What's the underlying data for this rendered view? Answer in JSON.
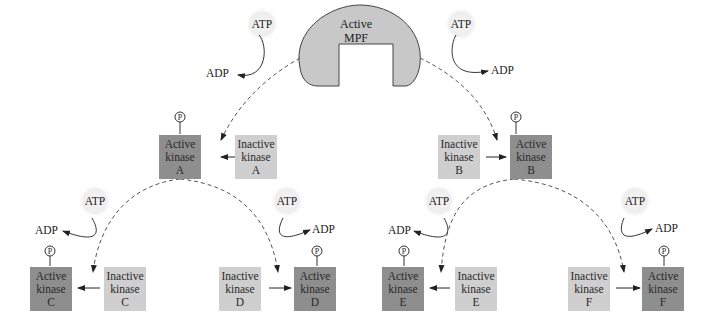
{
  "diagram": {
    "mpf": {
      "line1": "Active",
      "line2": "MPF"
    },
    "atp_label": "ATP",
    "adp_label": "ADP",
    "phosphate_label": "P",
    "colors": {
      "active": "#8e8e8e",
      "inactive": "#cfcfcf",
      "mpf": "#c8c8c8",
      "atp_glow": "#eeeeee"
    },
    "kinases": [
      {
        "id": "A",
        "active": [
          "Active",
          "kinase",
          "A"
        ],
        "inactive": [
          "Inactive",
          "kinase",
          "A"
        ]
      },
      {
        "id": "B",
        "active": [
          "Active",
          "kinase",
          "B"
        ],
        "inactive": [
          "Inactive",
          "kinase",
          "B"
        ]
      },
      {
        "id": "C",
        "active": [
          "Active",
          "kinase",
          "C"
        ],
        "inactive": [
          "Inactive",
          "kinase",
          "C"
        ]
      },
      {
        "id": "D",
        "active": [
          "Active",
          "kinase",
          "D"
        ],
        "inactive": [
          "Inactive",
          "kinase",
          "D"
        ]
      },
      {
        "id": "E",
        "active": [
          "Active",
          "kinase",
          "E"
        ],
        "inactive": [
          "Inactive",
          "kinase",
          "E"
        ]
      },
      {
        "id": "F",
        "active": [
          "Active",
          "kinase",
          "F"
        ],
        "inactive": [
          "Inactive",
          "kinase",
          "F"
        ]
      }
    ]
  }
}
